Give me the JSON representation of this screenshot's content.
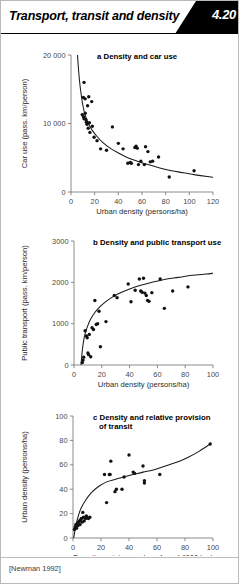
{
  "header": {
    "title": "Transport, transit and density",
    "badge_number": "4.20"
  },
  "source": {
    "citation": "[Newman 1992]"
  },
  "colors": {
    "ink": "#111111",
    "axis": "#6f6f6f",
    "badge_bg": "#000000",
    "badge_fg": "#ffffff",
    "page_bg": "#ffffff"
  },
  "chart_data": [
    {
      "id": "a",
      "type": "scatter",
      "title": "a Density and car use",
      "xlabel": "Urban density (persons/ha)",
      "ylabel": "Car use (pass. km/person)",
      "xlim": [
        0,
        120
      ],
      "ylim": [
        0,
        20000
      ],
      "xticks": [
        0,
        20,
        40,
        60,
        80,
        100,
        120
      ],
      "xticklabels": [
        "0",
        "20",
        "40",
        "60",
        "80",
        "100",
        "120"
      ],
      "yticks": [
        0,
        10000,
        20000
      ],
      "yticklabels": [
        "0",
        "10 000",
        "20 000"
      ],
      "grid": false,
      "legend": "none",
      "points": [
        [
          11.0,
          16000
        ],
        [
          10.5,
          13800
        ],
        [
          12.0,
          13600
        ],
        [
          15.0,
          13900
        ],
        [
          17.5,
          13200
        ],
        [
          14.0,
          12600
        ],
        [
          9.5,
          11300
        ],
        [
          10.5,
          11000
        ],
        [
          11.0,
          10700
        ],
        [
          12.0,
          11500
        ],
        [
          12.5,
          10600
        ],
        [
          13.0,
          10200
        ],
        [
          13.5,
          9900
        ],
        [
          14.5,
          9300
        ],
        [
          15.5,
          10100
        ],
        [
          16.0,
          8700
        ],
        [
          18.0,
          9600
        ],
        [
          19.5,
          8000
        ],
        [
          22.0,
          7500
        ],
        [
          25.0,
          6300
        ],
        [
          30.0,
          6100
        ],
        [
          35.0,
          9500
        ],
        [
          40.0,
          7100
        ],
        [
          44.0,
          6300
        ],
        [
          48.0,
          4200
        ],
        [
          50.0,
          4300
        ],
        [
          51.0,
          4200
        ],
        [
          54.0,
          6500
        ],
        [
          55.0,
          6700
        ],
        [
          56.0,
          6400
        ],
        [
          57.0,
          4000
        ],
        [
          59.0,
          4500
        ],
        [
          62.0,
          4000
        ],
        [
          63.0,
          6600
        ],
        [
          65.0,
          5900
        ],
        [
          67.0,
          4400
        ],
        [
          69.0,
          4500
        ],
        [
          74.0,
          5100
        ],
        [
          83.0,
          2200
        ],
        [
          104.0,
          3100
        ]
      ],
      "fit_curve": {
        "kind": "power-decay",
        "points": [
          [
            5.5,
            20000
          ],
          [
            6.5,
            17600
          ],
          [
            8,
            15000
          ],
          [
            10,
            12700
          ],
          [
            12,
            11200
          ],
          [
            15,
            9900
          ],
          [
            18,
            9000
          ],
          [
            22,
            8100
          ],
          [
            27,
            7200
          ],
          [
            33,
            6400
          ],
          [
            40,
            5700
          ],
          [
            48,
            5000
          ],
          [
            56,
            4500
          ],
          [
            65,
            4000
          ],
          [
            75,
            3500
          ],
          [
            85,
            3100
          ],
          [
            95,
            2800
          ],
          [
            105,
            2500
          ],
          [
            115,
            2250
          ],
          [
            120,
            2150
          ]
        ]
      }
    },
    {
      "id": "b",
      "type": "scatter",
      "title": "b Density and public transport use",
      "xlabel": "Urban density (persons/ha)",
      "ylabel": "Public transport (pass. km/person)",
      "xlim": [
        0,
        100
      ],
      "ylim": [
        0,
        3000
      ],
      "xticks": [
        0,
        20,
        40,
        60,
        80,
        100
      ],
      "xticklabels": [
        "0",
        "20",
        "40",
        "60",
        "80",
        "100"
      ],
      "yticks": [
        0,
        1000,
        2000,
        3000
      ],
      "yticklabels": [
        "0",
        "1000",
        "2000",
        "3000"
      ],
      "grid": false,
      "legend": "none",
      "points": [
        [
          6.0,
          60
        ],
        [
          6.5,
          120
        ],
        [
          7.0,
          190
        ],
        [
          8.0,
          830
        ],
        [
          9.0,
          700
        ],
        [
          9.5,
          660
        ],
        [
          10.0,
          290
        ],
        [
          10.5,
          250
        ],
        [
          11.0,
          740
        ],
        [
          12.0,
          200
        ],
        [
          13.0,
          900
        ],
        [
          14.0,
          860
        ],
        [
          15.0,
          1560
        ],
        [
          16.0,
          980
        ],
        [
          17.0,
          1000
        ],
        [
          18.0,
          1300
        ],
        [
          19.0,
          440
        ],
        [
          23.0,
          1050
        ],
        [
          29.0,
          1680
        ],
        [
          31.0,
          1630
        ],
        [
          39.0,
          1960
        ],
        [
          41.0,
          1530
        ],
        [
          44.0,
          1810
        ],
        [
          47.0,
          2080
        ],
        [
          48.0,
          1790
        ],
        [
          49.0,
          1760
        ],
        [
          50.0,
          2100
        ],
        [
          51.0,
          1740
        ],
        [
          52.0,
          1680
        ],
        [
          53.0,
          1560
        ],
        [
          54.0,
          1540
        ],
        [
          56.0,
          1750
        ],
        [
          62.0,
          2080
        ],
        [
          65.0,
          1370
        ],
        [
          71.0,
          1790
        ],
        [
          82.0,
          1890
        ]
      ],
      "fit_curve": {
        "kind": "log-saturating",
        "points": [
          [
            5.0,
            0
          ],
          [
            5.5,
            180
          ],
          [
            6,
            360
          ],
          [
            7,
            600
          ],
          [
            8,
            760
          ],
          [
            10,
            960
          ],
          [
            12,
            1110
          ],
          [
            15,
            1270
          ],
          [
            18,
            1390
          ],
          [
            22,
            1510
          ],
          [
            27,
            1630
          ],
          [
            33,
            1740
          ],
          [
            40,
            1840
          ],
          [
            48,
            1930
          ],
          [
            56,
            2000
          ],
          [
            65,
            2070
          ],
          [
            75,
            2120
          ],
          [
            85,
            2170
          ],
          [
            95,
            2200
          ],
          [
            100,
            2220
          ]
        ]
      }
    },
    {
      "id": "c",
      "type": "scatter",
      "title": "c Density and relative provision of transit",
      "title_line1": "c Density and relative provision",
      "title_line2": "of transit",
      "xlabel": "Transit provision per km of road ('000 km)",
      "ylabel": "Urban density (persons/ha)",
      "xlim": [
        0,
        100
      ],
      "ylim": [
        0,
        100
      ],
      "xticks": [
        0,
        20,
        40,
        60,
        80,
        100
      ],
      "xticklabels": [
        "0",
        "20",
        "40",
        "60",
        "80",
        "100"
      ],
      "yticks": [
        0,
        20,
        40,
        60,
        80,
        100
      ],
      "yticklabels": [
        "0",
        "20",
        "40",
        "60",
        "80",
        "100"
      ],
      "grid": false,
      "legend": "none",
      "points": [
        [
          1.0,
          7
        ],
        [
          1.5,
          9
        ],
        [
          2.0,
          11
        ],
        [
          2.5,
          8
        ],
        [
          3.0,
          12
        ],
        [
          3.5,
          10
        ],
        [
          4.0,
          13
        ],
        [
          4.5,
          14
        ],
        [
          5.0,
          11
        ],
        [
          5.5,
          15
        ],
        [
          6.0,
          16
        ],
        [
          6.5,
          13
        ],
        [
          7.0,
          21
        ],
        [
          7.5,
          17
        ],
        [
          8.0,
          14
        ],
        [
          9.0,
          16
        ],
        [
          9.5,
          18
        ],
        [
          10.0,
          17
        ],
        [
          11.0,
          16
        ],
        [
          12.0,
          17
        ],
        [
          22.5,
          52
        ],
        [
          24.0,
          29
        ],
        [
          26.0,
          52
        ],
        [
          26.5,
          52
        ],
        [
          27.0,
          63
        ],
        [
          30.0,
          38
        ],
        [
          31.0,
          40
        ],
        [
          35.0,
          40
        ],
        [
          36.5,
          50
        ],
        [
          40.0,
          68
        ],
        [
          43.0,
          54
        ],
        [
          44.0,
          53
        ],
        [
          50.0,
          59
        ],
        [
          51.0,
          47
        ],
        [
          51.0,
          45
        ],
        [
          62.0,
          52
        ],
        [
          98.0,
          77
        ]
      ],
      "fit_curve": {
        "kind": "rising-s",
        "points": [
          [
            0.5,
            0
          ],
          [
            2,
            10
          ],
          [
            4,
            19
          ],
          [
            6,
            25
          ],
          [
            9,
            31
          ],
          [
            13,
            37
          ],
          [
            18,
            42
          ],
          [
            24,
            46
          ],
          [
            30,
            48
          ],
          [
            36,
            50
          ],
          [
            43,
            52
          ],
          [
            50,
            54
          ],
          [
            58,
            56
          ],
          [
            66,
            59
          ],
          [
            74,
            62
          ],
          [
            82,
            66
          ],
          [
            90,
            71
          ],
          [
            98,
            77
          ]
        ]
      }
    }
  ]
}
